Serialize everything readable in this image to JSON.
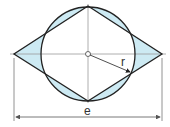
{
  "diagram": {
    "labels": {
      "radius": "r",
      "width": "e"
    },
    "colors": {
      "fill": "#cdeaf3",
      "stroke": "#222222",
      "axis": "#999999",
      "dimension": "#555555"
    },
    "shapes": [
      {
        "type": "circle",
        "name": "circle",
        "label": "r"
      },
      {
        "type": "rhombus",
        "name": "rhombus"
      },
      {
        "type": "dimension-line",
        "name": "width-dimension",
        "label": "e"
      }
    ]
  }
}
